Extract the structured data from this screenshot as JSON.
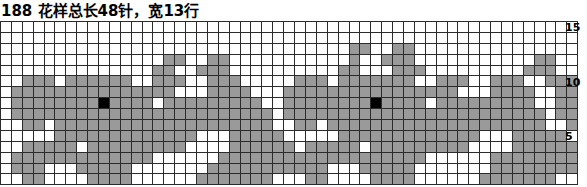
{
  "title": {
    "text": "188 花样总长48针，宽13行",
    "pattern_number": "188",
    "description": "花样总长48针，宽13行"
  },
  "chart_data": {
    "type": "heatmap",
    "title": "188 花样总长48针，宽13行",
    "xlabel": "",
    "ylabel": "",
    "columns": 53,
    "rows": 15,
    "legend": [
      {
        "key": "0",
        "label": "background-stitch",
        "color": "#ffffff"
      },
      {
        "key": "1",
        "label": "pattern-stitch",
        "color": "#9a9a9a"
      },
      {
        "key": "2",
        "label": "accent-stitch",
        "color": "#000000"
      }
    ],
    "row_tick_labels": [
      {
        "row_from_top": 1,
        "label": "15"
      },
      {
        "row_from_top": 6,
        "label": "10"
      },
      {
        "row_from_top": 11,
        "label": "5"
      }
    ],
    "grid": [
      [
        0,
        0,
        0,
        0,
        0,
        0,
        0,
        0,
        0,
        0,
        0,
        0,
        0,
        0,
        0,
        0,
        0,
        0,
        0,
        0,
        0,
        0,
        0,
        0,
        0,
        0,
        0,
        0,
        0,
        0,
        0,
        0,
        0,
        0,
        0,
        0,
        0,
        0,
        0,
        0,
        0,
        0,
        0,
        0,
        0,
        0,
        0,
        0,
        0,
        0,
        0,
        0,
        0
      ],
      [
        0,
        0,
        0,
        0,
        0,
        0,
        0,
        0,
        0,
        0,
        0,
        0,
        0,
        0,
        0,
        0,
        0,
        0,
        0,
        0,
        0,
        0,
        0,
        0,
        0,
        0,
        0,
        0,
        0,
        0,
        0,
        0,
        0,
        0,
        0,
        0,
        0,
        0,
        0,
        0,
        0,
        0,
        0,
        0,
        0,
        0,
        0,
        0,
        0,
        0,
        0,
        0,
        0
      ],
      [
        0,
        0,
        0,
        0,
        0,
        0,
        0,
        0,
        0,
        0,
        0,
        0,
        0,
        0,
        0,
        0,
        0,
        0,
        0,
        0,
        0,
        0,
        0,
        0,
        0,
        0,
        0,
        0,
        0,
        0,
        0,
        0,
        1,
        1,
        0,
        0,
        1,
        1,
        0,
        0,
        0,
        0,
        0,
        0,
        0,
        0,
        0,
        0,
        0,
        0,
        0,
        0,
        0
      ],
      [
        0,
        0,
        0,
        0,
        0,
        0,
        0,
        0,
        0,
        0,
        0,
        0,
        0,
        0,
        0,
        1,
        1,
        0,
        0,
        1,
        1,
        0,
        0,
        0,
        0,
        0,
        0,
        0,
        0,
        0,
        0,
        0,
        1,
        0,
        0,
        1,
        1,
        1,
        0,
        0,
        0,
        0,
        0,
        0,
        0,
        0,
        0,
        0,
        0,
        1,
        1,
        0,
        0
      ],
      [
        0,
        0,
        0,
        0,
        0,
        0,
        0,
        0,
        0,
        0,
        0,
        0,
        0,
        0,
        1,
        1,
        0,
        0,
        1,
        1,
        1,
        0,
        0,
        0,
        0,
        0,
        0,
        0,
        0,
        0,
        0,
        1,
        1,
        0,
        0,
        0,
        1,
        1,
        1,
        0,
        0,
        0,
        0,
        0,
        0,
        0,
        0,
        0,
        1,
        1,
        1,
        0,
        0
      ],
      [
        0,
        0,
        1,
        1,
        1,
        0,
        1,
        1,
        1,
        1,
        1,
        1,
        0,
        0,
        1,
        1,
        1,
        0,
        0,
        1,
        1,
        1,
        0,
        0,
        0,
        0,
        0,
        1,
        1,
        1,
        0,
        1,
        1,
        1,
        1,
        1,
        1,
        1,
        0,
        0,
        1,
        1,
        1,
        0,
        0,
        1,
        1,
        1,
        0,
        0,
        1,
        1,
        1
      ],
      [
        0,
        1,
        1,
        1,
        1,
        1,
        1,
        1,
        1,
        1,
        1,
        1,
        1,
        1,
        1,
        1,
        0,
        0,
        0,
        1,
        1,
        1,
        1,
        0,
        0,
        0,
        1,
        1,
        1,
        1,
        1,
        1,
        1,
        1,
        1,
        1,
        1,
        1,
        1,
        1,
        1,
        1,
        0,
        0,
        0,
        1,
        1,
        1,
        1,
        0,
        0,
        1,
        1
      ],
      [
        0,
        1,
        1,
        1,
        1,
        1,
        1,
        1,
        1,
        2,
        1,
        1,
        1,
        1,
        0,
        1,
        1,
        1,
        1,
        1,
        1,
        1,
        1,
        1,
        0,
        0,
        1,
        1,
        1,
        1,
        1,
        1,
        1,
        1,
        2,
        1,
        1,
        1,
        1,
        0,
        1,
        1,
        1,
        1,
        1,
        1,
        1,
        1,
        1,
        0,
        0,
        1,
        1
      ],
      [
        0,
        1,
        1,
        1,
        1,
        1,
        1,
        1,
        1,
        1,
        1,
        1,
        1,
        1,
        1,
        1,
        1,
        1,
        1,
        1,
        1,
        1,
        1,
        1,
        1,
        0,
        1,
        1,
        1,
        1,
        1,
        1,
        1,
        1,
        1,
        1,
        1,
        1,
        1,
        1,
        1,
        1,
        1,
        1,
        1,
        1,
        1,
        1,
        1,
        1,
        0,
        1,
        1
      ],
      [
        0,
        0,
        1,
        1,
        0,
        1,
        1,
        1,
        1,
        1,
        1,
        1,
        1,
        1,
        1,
        1,
        1,
        1,
        1,
        1,
        1,
        1,
        1,
        1,
        1,
        0,
        0,
        1,
        1,
        0,
        1,
        1,
        1,
        1,
        1,
        1,
        1,
        1,
        1,
        1,
        1,
        1,
        1,
        1,
        1,
        1,
        1,
        1,
        1,
        1,
        0,
        0,
        1
      ],
      [
        0,
        0,
        0,
        0,
        0,
        1,
        1,
        1,
        1,
        1,
        1,
        1,
        1,
        1,
        1,
        1,
        1,
        1,
        0,
        0,
        0,
        1,
        1,
        1,
        1,
        1,
        0,
        0,
        0,
        0,
        0,
        1,
        1,
        1,
        1,
        1,
        1,
        1,
        1,
        1,
        1,
        1,
        1,
        1,
        0,
        0,
        0,
        1,
        1,
        1,
        1,
        1,
        0
      ],
      [
        0,
        0,
        1,
        1,
        1,
        1,
        1,
        0,
        1,
        1,
        1,
        1,
        1,
        1,
        1,
        1,
        1,
        0,
        0,
        0,
        0,
        1,
        1,
        1,
        1,
        1,
        1,
        0,
        1,
        1,
        1,
        1,
        1,
        0,
        1,
        1,
        1,
        1,
        1,
        1,
        1,
        1,
        1,
        0,
        0,
        0,
        0,
        1,
        1,
        1,
        1,
        1,
        1
      ],
      [
        0,
        1,
        1,
        1,
        1,
        1,
        1,
        1,
        1,
        1,
        1,
        1,
        1,
        1,
        0,
        0,
        0,
        0,
        0,
        0,
        1,
        1,
        1,
        1,
        1,
        1,
        1,
        1,
        1,
        1,
        1,
        1,
        1,
        1,
        1,
        1,
        1,
        1,
        1,
        0,
        0,
        0,
        0,
        0,
        0,
        1,
        1,
        1,
        1,
        1,
        1,
        1,
        1
      ],
      [
        0,
        1,
        1,
        1,
        0,
        0,
        0,
        1,
        1,
        1,
        1,
        1,
        0,
        0,
        0,
        0,
        0,
        0,
        0,
        1,
        1,
        1,
        1,
        1,
        1,
        1,
        1,
        1,
        1,
        1,
        0,
        0,
        0,
        1,
        1,
        1,
        1,
        1,
        0,
        0,
        0,
        0,
        0,
        0,
        0,
        1,
        1,
        1,
        1,
        1,
        1,
        1,
        1
      ],
      [
        0,
        0,
        1,
        1,
        0,
        0,
        0,
        0,
        1,
        1,
        1,
        1,
        0,
        0,
        0,
        0,
        0,
        0,
        1,
        1,
        1,
        1,
        1,
        1,
        1,
        0,
        0,
        0,
        1,
        1,
        0,
        0,
        0,
        0,
        1,
        1,
        1,
        1,
        0,
        0,
        0,
        0,
        0,
        0,
        1,
        1,
        1,
        1,
        1,
        1,
        1,
        0,
        0
      ]
    ]
  }
}
